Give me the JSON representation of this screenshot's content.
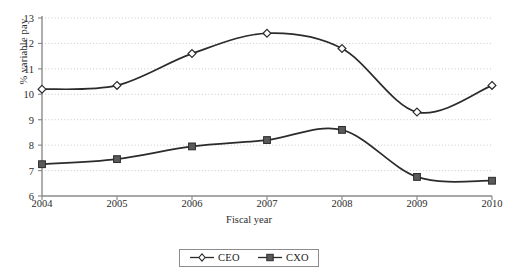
{
  "chart_data": {
    "type": "line",
    "title": "",
    "subtitle": "",
    "xlabel": "Fiscal year",
    "ylabel": "% variable pay",
    "categories": [
      "2004",
      "2005",
      "2006",
      "2007",
      "2008",
      "2009",
      "2010"
    ],
    "x": [
      2004,
      2005,
      2006,
      2007,
      2008,
      2009,
      2010
    ],
    "xlim": [
      2004,
      2010
    ],
    "ylim": [
      6,
      13
    ],
    "yticks": [
      6,
      7,
      8,
      9,
      10,
      11,
      12,
      13
    ],
    "ytick_labels": [
      "6",
      "7",
      "8",
      "9",
      "10",
      "11",
      "12",
      "13"
    ],
    "grid": "horizontal-dotted",
    "legend_position": "bottom-center",
    "smooth": true,
    "series": [
      {
        "name": "CEO",
        "marker": "open-diamond",
        "marker_fill": "#ffffff",
        "line_color": "#2b2b2b",
        "values": [
          10.2,
          10.35,
          11.6,
          12.4,
          11.8,
          9.3,
          10.35
        ]
      },
      {
        "name": "CXO",
        "marker": "filled-square",
        "marker_fill": "#5a5a5a",
        "line_color": "#2b2b2b",
        "values": [
          7.25,
          7.45,
          7.95,
          8.2,
          8.6,
          6.75,
          6.6
        ]
      }
    ]
  },
  "legend": {
    "items": [
      {
        "label": "CEO"
      },
      {
        "label": "CXO"
      }
    ]
  },
  "axis": {
    "y_title": "% variable pay",
    "x_title": "Fiscal year"
  }
}
